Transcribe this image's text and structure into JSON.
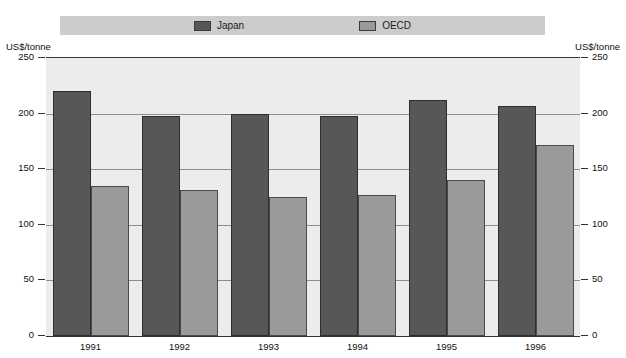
{
  "legend": {
    "entries": [
      {
        "label": "Japan",
        "color": "#575757",
        "icon": "legend-swatch-icon"
      },
      {
        "label": "OECD",
        "color": "#9a9a9a",
        "icon": "legend-swatch-icon"
      }
    ]
  },
  "axis": {
    "unit_left": "US$/tonne",
    "unit_right": "US$/tonne",
    "ticks": [
      "250",
      "200",
      "150",
      "100",
      "50",
      "0"
    ]
  },
  "chart_data": {
    "type": "bar",
    "title": "",
    "subtitle": "",
    "xlabel": "",
    "ylabel": "US$/tonne",
    "ylim": [
      0,
      250
    ],
    "yticks": [
      0,
      50,
      100,
      150,
      200,
      250
    ],
    "grid": true,
    "legend_position": "top",
    "categories": [
      "1991",
      "1992",
      "1993",
      "1994",
      "1995",
      "1996"
    ],
    "series": [
      {
        "name": "Japan",
        "color": "#575757",
        "values": [
          220,
          198,
          200,
          198,
          212,
          207
        ]
      },
      {
        "name": "OECD",
        "color": "#9a9a9a",
        "values": [
          135,
          131,
          125,
          127,
          140,
          172
        ]
      }
    ]
  }
}
